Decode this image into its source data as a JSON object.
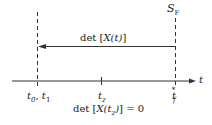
{
  "diagram": {
    "axis": {
      "label": "t"
    },
    "surface_label": {
      "main": "S",
      "sub": "F"
    },
    "arrow_label": {
      "prefix": "det [",
      "var": "X",
      "arg": "(t)",
      "suffix": "]"
    },
    "ticks": [
      {
        "id": "t0-t1",
        "text_a": "t",
        "sub_a": "0",
        "sep": ", ",
        "text_b": "t",
        "sub_b": "1"
      },
      {
        "id": "tz",
        "text": "t",
        "sub": "z"
      },
      {
        "id": "tf-star",
        "text": "t",
        "sub": "f",
        "sup": "*"
      }
    ],
    "condition": {
      "prefix": "det [",
      "var": "X",
      "arg_open": "(t",
      "arg_sub": "z",
      "arg_close": ")",
      "suffix": "] = 0"
    },
    "colors": {
      "line": "#333333",
      "background": "#ffffff"
    }
  }
}
